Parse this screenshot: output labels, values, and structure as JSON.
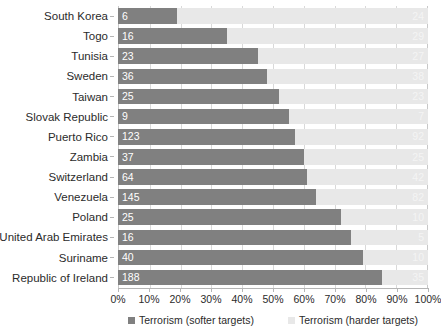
{
  "chart_data": {
    "type": "bar",
    "subtype": "stacked-horizontal-100percent",
    "title": "",
    "xlabel": "",
    "ylabel": "",
    "xlim": [
      0,
      100
    ],
    "xticks": [
      0,
      10,
      20,
      30,
      40,
      50,
      60,
      70,
      80,
      90,
      100
    ],
    "xticklabels": [
      "0%",
      "10%",
      "20%",
      "30%",
      "40%",
      "50%",
      "60%",
      "70%",
      "80%",
      "90%",
      "100%"
    ],
    "grid": true,
    "legend_position": "bottom",
    "categories": [
      "South Korea",
      "Togo",
      "Tunisia",
      "Sweden",
      "Taiwan",
      "Slovak Republic",
      "Puerto Rico",
      "Zambia",
      "Switzerland",
      "Venezuela",
      "Poland",
      "United Arab Emirates",
      "Suriname",
      "Republic of Ireland"
    ],
    "series": [
      {
        "name": "Terrorism (softer targets)",
        "color": "#808080",
        "labels": [
          "6",
          "16",
          "23",
          "36",
          "25",
          "9",
          "123",
          "37",
          "64",
          "145",
          "25",
          "16",
          "40",
          "188"
        ],
        "percents": [
          19,
          35,
          45,
          48,
          52,
          55,
          57,
          60,
          61,
          64,
          72,
          75,
          79,
          85
        ]
      },
      {
        "name": "Terrorism (harder targets)",
        "color": "#e8e8e8",
        "labels": [
          "24",
          "29",
          "27",
          "38",
          "23",
          "7",
          "92",
          "25",
          "42",
          "82",
          "10",
          "5",
          "10",
          "35"
        ],
        "percents": [
          81,
          65,
          55,
          52,
          48,
          45,
          43,
          40,
          39,
          36,
          28,
          25,
          21,
          15
        ]
      }
    ]
  }
}
